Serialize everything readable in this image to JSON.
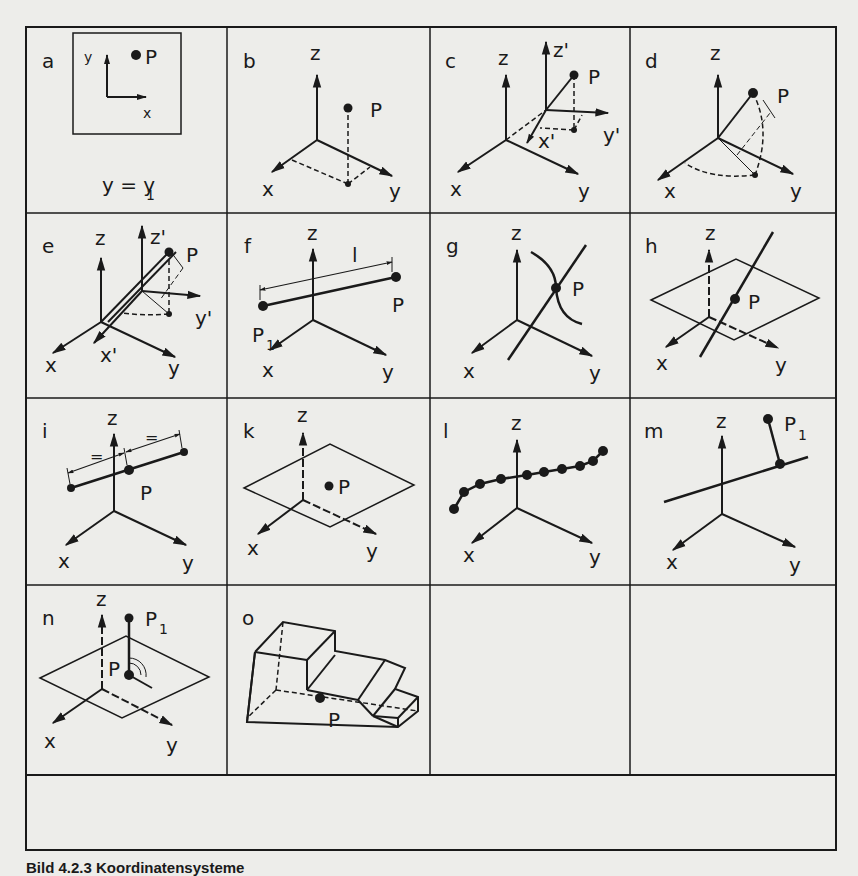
{
  "figure": {
    "caption": "Bild 4.2.3 Koordinatensysteme",
    "grid": {
      "columns": 4,
      "rows": 4,
      "footer_row": true
    },
    "panels": [
      {
        "id": "a",
        "label": "a",
        "axis_labels": [
          "y",
          "x"
        ],
        "point": "P",
        "equation": "y = y",
        "equation_sub": "1"
      },
      {
        "id": "b",
        "label": "b",
        "axis_labels": [
          "z",
          "x",
          "y"
        ],
        "point": "P"
      },
      {
        "id": "c",
        "label": "c",
        "axis_labels": [
          "z",
          "x",
          "y",
          "z'",
          "x'",
          "y'"
        ],
        "point": "P"
      },
      {
        "id": "d",
        "label": "d",
        "axis_labels": [
          "z",
          "x",
          "y"
        ],
        "point": "P"
      },
      {
        "id": "e",
        "label": "e",
        "axis_labels": [
          "z",
          "x",
          "y",
          "z'",
          "x'",
          "y'"
        ],
        "point": "P"
      },
      {
        "id": "f",
        "label": "f",
        "axis_labels": [
          "z",
          "x",
          "y"
        ],
        "point": "P",
        "point2": "P",
        "point2_sub": "1",
        "length": "l"
      },
      {
        "id": "g",
        "label": "g",
        "axis_labels": [
          "z",
          "x",
          "y"
        ],
        "point": "P"
      },
      {
        "id": "h",
        "label": "h",
        "axis_labels": [
          "z",
          "x",
          "y"
        ],
        "point": "P"
      },
      {
        "id": "i",
        "label": "i",
        "axis_labels": [
          "z",
          "x",
          "y"
        ],
        "point": "P",
        "equal_marks": "="
      },
      {
        "id": "k",
        "label": "k",
        "axis_labels": [
          "z",
          "x",
          "y"
        ],
        "point": "P"
      },
      {
        "id": "l",
        "label": "l",
        "axis_labels": [
          "z",
          "x",
          "y"
        ]
      },
      {
        "id": "m",
        "label": "m",
        "axis_labels": [
          "z",
          "x",
          "y"
        ],
        "point": "P",
        "point_sub": "1"
      },
      {
        "id": "n",
        "label": "n",
        "axis_labels": [
          "z",
          "x",
          "y"
        ],
        "point": "P",
        "point2": "P",
        "point2_sub": "1"
      },
      {
        "id": "o",
        "label": "o",
        "point": "P"
      },
      {
        "id": "empty1",
        "label": ""
      },
      {
        "id": "empty2",
        "label": ""
      }
    ]
  }
}
